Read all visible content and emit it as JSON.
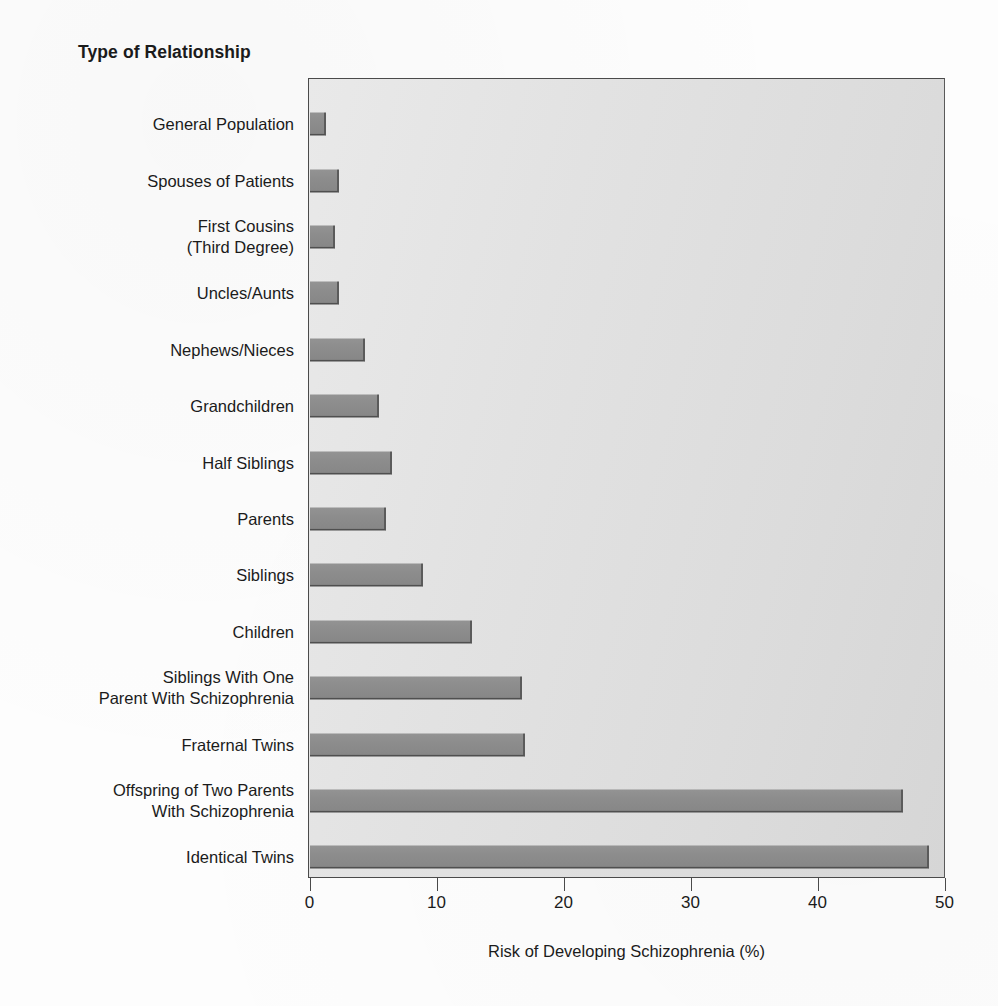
{
  "chart_data": {
    "type": "bar",
    "orientation": "horizontal",
    "title": "Type of Relationship",
    "xlabel": "Risk of Developing Schizophrenia (%)",
    "ylabel": "Type of Relationship",
    "xlim": [
      0,
      50
    ],
    "xticks": [
      0,
      10,
      20,
      30,
      40,
      50
    ],
    "xtick_labels": [
      "0",
      "10",
      "20",
      "30",
      "40",
      "50"
    ],
    "grid": false,
    "legend": null,
    "bar_color": "#8d8d8d",
    "plot_background": "#e2e2e2",
    "axis_color": "#4a4a4a",
    "categories": [
      "General Population",
      "Spouses of Patients",
      "First Cousins\n(Third Degree)",
      "Uncles/Aunts",
      "Nephews/Nieces",
      "Grandchildren",
      "Half Siblings",
      "Parents",
      "Siblings",
      "Children",
      "Siblings With One\nParent With Schizophrenia",
      "Fraternal Twins",
      "Offspring of Two Parents\nWith Schizophrenia",
      "Identical Twins"
    ],
    "values": [
      1.3,
      2.3,
      2.0,
      2.3,
      4.4,
      5.5,
      6.5,
      6.0,
      8.9,
      12.8,
      16.7,
      17.0,
      46.7,
      48.8
    ]
  }
}
